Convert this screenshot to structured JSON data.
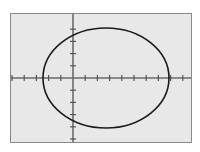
{
  "view": {
    "title": "Graphing calculator plot of an ellipse",
    "outer_background": "#ffffff",
    "plot_background": "#e8e8e8",
    "frame_color": "#8a8a8a",
    "axis_color": "#6b6b6b",
    "curve_color": "#1a1a1a",
    "tick_color": "#555555"
  },
  "chart_data": {
    "type": "line",
    "title": "",
    "xlabel": "",
    "ylabel": "",
    "grid": false,
    "legend": null,
    "axes": {
      "x_axis_shown": true,
      "y_axis_shown": true,
      "origin_x_px": 62,
      "origin_y_px": 64,
      "x_tick_spacing_px": 12.2,
      "y_tick_spacing_px": 12.2,
      "x_tick_count_left": 5,
      "x_tick_count_right": 9,
      "y_tick_count_up": 4,
      "y_tick_count_down": 5,
      "tick_half_length_px": 3,
      "xlim": [
        -5.1,
        10.6
      ],
      "ylim": [
        -5.2,
        5.2
      ]
    },
    "series": [
      {
        "name": "ellipse",
        "shape": "ellipse",
        "center": [
          2.7,
          0.1
        ],
        "semi_axis_x": 5.2,
        "semi_axis_y": 4.1,
        "center_px": [
          95,
          64
        ],
        "radius_x_px": 63,
        "radius_y_px": 50,
        "stroke_width_px": 1.6,
        "closed": true
      }
    ]
  }
}
